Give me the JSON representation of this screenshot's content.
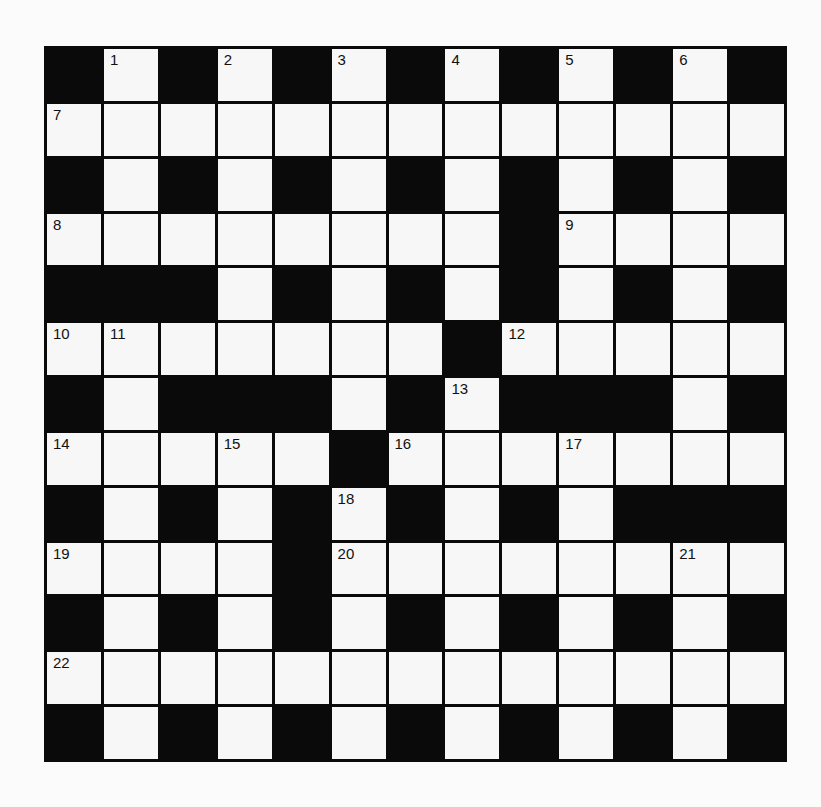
{
  "puzzle": {
    "rows": 13,
    "cols": 13,
    "colors": {
      "block": "#0a0a0a",
      "cell": "#f7f7f7",
      "background": "#fbfbfb",
      "number": "#111111"
    },
    "grid": [
      [
        "#",
        "1",
        "#",
        "2",
        "#",
        "3",
        "#",
        "4",
        "#",
        "5",
        "#",
        "6",
        "#"
      ],
      [
        "7",
        ".",
        ".",
        ".",
        ".",
        ".",
        ".",
        ".",
        ".",
        ".",
        ".",
        ".",
        "."
      ],
      [
        "#",
        ".",
        "#",
        ".",
        "#",
        ".",
        "#",
        ".",
        "#",
        ".",
        "#",
        ".",
        "#"
      ],
      [
        "8",
        ".",
        ".",
        ".",
        ".",
        ".",
        ".",
        ".",
        "#",
        "9",
        ".",
        ".",
        "."
      ],
      [
        "#",
        "#",
        "#",
        ".",
        "#",
        ".",
        "#",
        ".",
        "#",
        ".",
        "#",
        ".",
        "#"
      ],
      [
        "10",
        "11",
        ".",
        ".",
        ".",
        ".",
        ".",
        "#",
        "12",
        ".",
        ".",
        ".",
        "."
      ],
      [
        "#",
        ".",
        "#",
        "#",
        "#",
        ".",
        "#",
        "13",
        "#",
        "#",
        "#",
        ".",
        "#"
      ],
      [
        "14",
        ".",
        ".",
        "15",
        ".",
        "#",
        "16",
        ".",
        ".",
        "17",
        ".",
        ".",
        "."
      ],
      [
        "#",
        ".",
        "#",
        ".",
        "#",
        "18",
        "#",
        ".",
        "#",
        ".",
        "#",
        "#",
        "#"
      ],
      [
        "19",
        ".",
        ".",
        ".",
        "#",
        "20",
        ".",
        ".",
        ".",
        ".",
        ".",
        "21",
        "."
      ],
      [
        "#",
        ".",
        "#",
        ".",
        "#",
        ".",
        "#",
        ".",
        "#",
        ".",
        "#",
        ".",
        "#"
      ],
      [
        "22",
        ".",
        ".",
        ".",
        ".",
        ".",
        ".",
        ".",
        ".",
        ".",
        ".",
        ".",
        "."
      ],
      [
        "#",
        ".",
        "#",
        ".",
        "#",
        ".",
        "#",
        ".",
        "#",
        ".",
        "#",
        ".",
        "#"
      ]
    ],
    "clue_numbers": [
      "1",
      "2",
      "3",
      "4",
      "5",
      "6",
      "7",
      "8",
      "9",
      "10",
      "11",
      "12",
      "13",
      "14",
      "15",
      "16",
      "17",
      "18",
      "19",
      "20",
      "21",
      "22"
    ]
  }
}
